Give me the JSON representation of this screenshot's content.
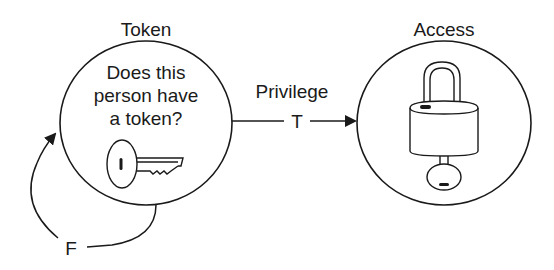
{
  "diagram": {
    "nodes": [
      {
        "id": "token",
        "title": "Token",
        "question_lines": [
          "Does this",
          "person have",
          "a token?"
        ],
        "icon": "key-icon"
      },
      {
        "id": "access",
        "title": "Access",
        "icon": "padlock-with-key-icon"
      }
    ],
    "edges": [
      {
        "from": "token",
        "to": "access",
        "label": "Privilege",
        "condition": "T"
      },
      {
        "from": "token",
        "to": "token",
        "condition": "F"
      }
    ],
    "colors": {
      "stroke": "#1a1a1a",
      "background": "#ffffff"
    }
  }
}
